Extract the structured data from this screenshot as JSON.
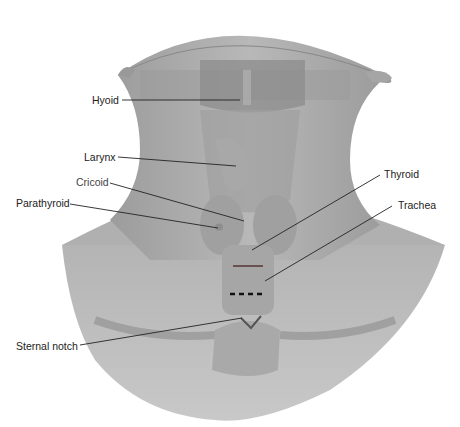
{
  "diagram": {
    "labels": [
      {
        "id": "hyoid",
        "text": "Hyoid"
      },
      {
        "id": "larynx",
        "text": "Larynx"
      },
      {
        "id": "cricoid",
        "text": "Cricoid"
      },
      {
        "id": "parathyroid",
        "text": "Parathyroid"
      },
      {
        "id": "thyroid",
        "text": "Thyroid"
      },
      {
        "id": "trachea",
        "text": "Trachea"
      },
      {
        "id": "sternal_notch",
        "text": "Sternal notch"
      }
    ],
    "colors": {
      "skin": "#a8a8a8",
      "skin_light": "#c4c4c4",
      "organ": "#9a9a9a",
      "line": "#222222",
      "marker_red": "#6a5050"
    }
  }
}
